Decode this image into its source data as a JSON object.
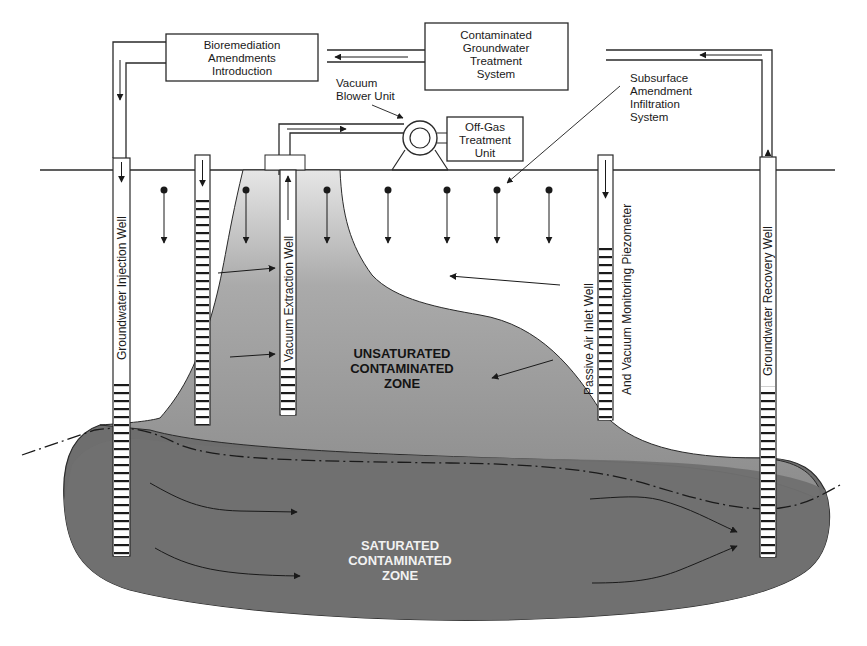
{
  "diagram": {
    "boxes": {
      "bioremediation": [
        "Bioremediation",
        "Amendments",
        "Introduction"
      ],
      "treatment_system": [
        "Contaminated",
        "Groundwater",
        "Treatment",
        "System"
      ],
      "off_gas": [
        "Off-Gas",
        "Treatment",
        "Unit"
      ]
    },
    "callouts": {
      "vacuum_blower": [
        "Vacuum",
        "Blower Unit"
      ],
      "subsurface_amendment": [
        "Subsurface",
        "Amendment",
        "Infiltration",
        "System"
      ]
    },
    "wells": {
      "injection": "Groundwater Injection Well",
      "vacuum_extraction": "Vacuum Extraction Well",
      "passive_air_1": "Passive Air Inlet Well",
      "passive_air_2": "And Vacuum Monitoring Piezometer",
      "recovery": "Groundwater Recovery Well"
    },
    "zones": {
      "unsaturated": [
        "UNSATURATED",
        "CONTAMINATED",
        "ZONE"
      ],
      "saturated": [
        "SATURATED",
        "CONTAMINATED",
        "ZONE"
      ]
    },
    "colors": {
      "line": "#2a2a2a",
      "unsaturated_fill": "#9a9a9a",
      "saturated_fill": "#6e6e6e",
      "background": "#ffffff"
    }
  }
}
